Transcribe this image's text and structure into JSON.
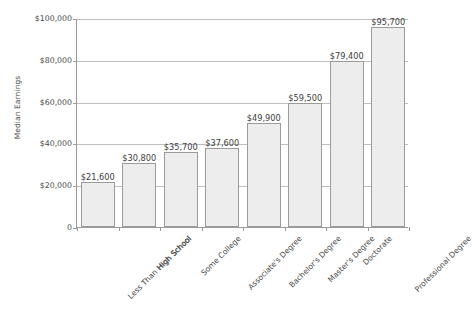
{
  "chart_data": {
    "type": "bar",
    "title": "",
    "xlabel": "",
    "ylabel": "Median Earnings",
    "ylim": [
      0,
      100000
    ],
    "grid": true,
    "legend": false,
    "categories": [
      "Less Than High School",
      "High School",
      "Some College",
      "Associate's Degree",
      "Bachelor's Degree",
      "Master's Degree",
      "Doctorate",
      "Professional Degree"
    ],
    "values": [
      21600,
      30800,
      35700,
      37600,
      49900,
      59500,
      79400,
      95700
    ],
    "value_labels": [
      "$21,600",
      "$30,800",
      "$35,700",
      "$37,600",
      "$49,900",
      "$59,500",
      "$79,400",
      "$95,700"
    ],
    "y_ticks": [
      0,
      20000,
      40000,
      60000,
      80000,
      100000
    ],
    "y_tick_labels": [
      "0",
      "$20,000",
      "$40,000",
      "$60,000",
      "$80,000",
      "$100,000"
    ],
    "colors": {
      "bar_fill": "#ededed",
      "bar_border": "#9b9b9b",
      "gridline": "#bfbfbf",
      "axis": "#9a9a9a",
      "text": "#4a4a4a"
    }
  }
}
